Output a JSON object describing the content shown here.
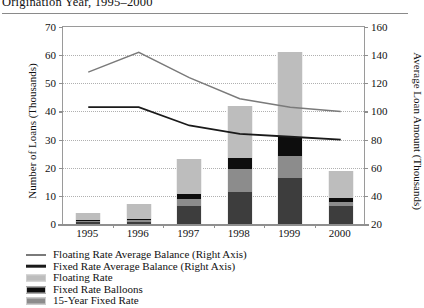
{
  "title": "Origination Year, 1995–2000",
  "chart_data": {
    "type": "bar",
    "subtype": "stacked-bar-with-lines",
    "title": "Origination Year, 1995–2000",
    "xlabel": "",
    "ylabel": "Number of Loans (Thousands)",
    "y2label": "Average Loan Amount (Thousands)",
    "categories": [
      "1995",
      "1996",
      "1997",
      "1998",
      "1999",
      "2000"
    ],
    "ylim": [
      0,
      70
    ],
    "yticks": [
      0,
      10,
      20,
      30,
      40,
      50,
      60,
      70
    ],
    "y2lim": [
      20,
      160
    ],
    "y2ticks": [
      20,
      40,
      60,
      80,
      100,
      120,
      140,
      160
    ],
    "grid": true,
    "legend_position": "below",
    "bar_series": [
      {
        "name": "15-Year Fixed Rate",
        "color": "#3d3d3d",
        "axis": "left",
        "values": [
          0.6,
          0.8,
          6.5,
          11.5,
          16.5,
          6.5
        ]
      },
      {
        "name": "Floating Rate",
        "color": "#8c8c8c",
        "axis": "left",
        "values": [
          0.5,
          0.6,
          2.5,
          8.0,
          7.5,
          1.5
        ]
      },
      {
        "name": "Fixed Rate Balloons",
        "color": "#0d0d0d",
        "axis": "left",
        "values": [
          0.3,
          0.4,
          1.8,
          4.0,
          7.0,
          1.2
        ]
      },
      {
        "name": "Fixed Rate (30-Year)",
        "color": "#bdbdbd",
        "axis": "left",
        "values": [
          2.6,
          5.2,
          12.2,
          18.5,
          30.0,
          9.8
        ]
      }
    ],
    "bar_totals": [
      4.0,
      7.0,
      23.0,
      42.0,
      61.0,
      19.0
    ],
    "line_series": [
      {
        "name": "Floating Rate Average Balance (Right Axis)",
        "color": "#7a7a7a",
        "width": 1.4,
        "axis": "right",
        "values": [
          128,
          142,
          124,
          109,
          103,
          100
        ]
      },
      {
        "name": "Fixed Rate Average Balance (Right Axis)",
        "color": "#1a1a1a",
        "width": 1.8,
        "axis": "right",
        "values": [
          103,
          103,
          90,
          84,
          82,
          80
        ]
      }
    ]
  },
  "legend": {
    "items": [
      {
        "label": "Floating Rate Average Balance (Right Axis)",
        "color": "#7a7a7a",
        "marker": "line",
        "thickness": 2
      },
      {
        "label": "Fixed Rate Average Balance (Right Axis)",
        "color": "#1a1a1a",
        "marker": "line",
        "thickness": 2.6
      },
      {
        "label": "Floating Rate",
        "color": "#bdbdbd",
        "marker": "box"
      },
      {
        "label": "Fixed Rate Balloons",
        "color": "#0d0d0d",
        "marker": "box"
      },
      {
        "label": "15-Year Fixed Rate",
        "color": "#8c8c8c",
        "marker": "box"
      }
    ]
  },
  "colors": {
    "axis": "#8f8f8f",
    "grid": "#b0b0b0",
    "text": "#111111",
    "background": "#ffffff"
  }
}
